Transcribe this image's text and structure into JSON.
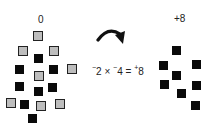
{
  "left": {
    "label": "0",
    "squares": [
      {
        "kind": "gray",
        "x": 33,
        "y": 31
      },
      {
        "kind": "gray",
        "x": 18,
        "y": 46
      },
      {
        "kind": "gray",
        "x": 49,
        "y": 46
      },
      {
        "kind": "black",
        "x": 34,
        "y": 54
      },
      {
        "kind": "black",
        "x": 15,
        "y": 65
      },
      {
        "kind": "gray",
        "x": 34,
        "y": 71
      },
      {
        "kind": "black",
        "x": 49,
        "y": 65
      },
      {
        "kind": "gray",
        "x": 67,
        "y": 64
      },
      {
        "kind": "black",
        "x": 15,
        "y": 82
      },
      {
        "kind": "black",
        "x": 34,
        "y": 87
      },
      {
        "kind": "black",
        "x": 48,
        "y": 83
      },
      {
        "kind": "gray",
        "x": 6,
        "y": 98
      },
      {
        "kind": "black",
        "x": 20,
        "y": 100
      },
      {
        "kind": "gray",
        "x": 36,
        "y": 101
      },
      {
        "kind": "gray",
        "x": 55,
        "y": 99
      },
      {
        "kind": "black",
        "x": 28,
        "y": 114
      }
    ]
  },
  "right": {
    "label": "+8",
    "squares": [
      {
        "kind": "black",
        "x": 172,
        "y": 46
      },
      {
        "kind": "black",
        "x": 159,
        "y": 61
      },
      {
        "kind": "black",
        "x": 192,
        "y": 60
      },
      {
        "kind": "black",
        "x": 172,
        "y": 71
      },
      {
        "kind": "black",
        "x": 160,
        "y": 80
      },
      {
        "kind": "black",
        "x": 192,
        "y": 81
      },
      {
        "kind": "black",
        "x": 177,
        "y": 89
      },
      {
        "kind": "black",
        "x": 191,
        "y": 101
      }
    ]
  },
  "equation": {
    "a_sign": "−",
    "a": "2",
    "times": " × ",
    "b_sign": "−",
    "b": "4",
    "equals": " = ",
    "r_sign": "+",
    "r": "8"
  }
}
